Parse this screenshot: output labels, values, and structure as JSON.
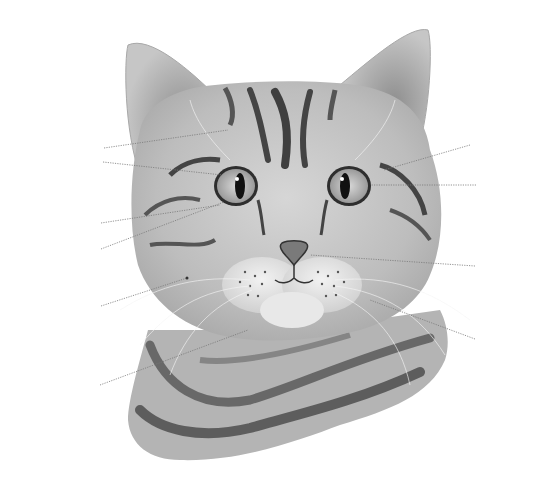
{
  "diagram": {
    "labels": [
      {
        "id": "sourcils",
        "fr": "sourcils",
        "gender": "M",
        "en": "whiskers",
        "side": "left"
      },
      {
        "id": "paupiere-superieure",
        "fr": "paupière",
        "gender": "F",
        "fr_suffix": "supérieure",
        "en": "upper eyelid",
        "side": "left"
      },
      {
        "id": "paupiere-inferieure",
        "fr": "paupière",
        "gender": "F",
        "fr_suffix": "inférieure",
        "en": "lower eyelid",
        "side": "left"
      },
      {
        "id": "paupiere-interne",
        "fr": "paupière",
        "gender": "F",
        "fr_suffix": "interne",
        "en": "nictitating membrane",
        "side": "left"
      },
      {
        "id": "moustaches",
        "fr": "moustaches",
        "gender": "F",
        "en": "whiskers",
        "side": "left"
      },
      {
        "id": "levre",
        "fr": "lèvre",
        "gender": "F",
        "en": "lip",
        "side": "left"
      },
      {
        "id": "cils",
        "fr": "cils",
        "gender": "M",
        "en": "eyelashes",
        "side": "right"
      },
      {
        "id": "pupille",
        "fr": "pupille",
        "gender": "F",
        "en": "pupil",
        "side": "right"
      },
      {
        "id": "truffe",
        "fr": "truffe",
        "gender": "F",
        "en": "nose leather",
        "side": "right"
      },
      {
        "id": "museau",
        "fr": "museau",
        "gender": "M",
        "en": "muzzle",
        "side": "right"
      }
    ]
  }
}
